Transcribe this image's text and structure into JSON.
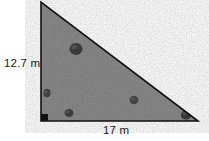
{
  "figure": {
    "type": "right-triangle-diagram",
    "shape_name": "right triangle",
    "background_color": "#ffffff",
    "fill_color": "#8a8a8a",
    "fill_description": "gravel texture",
    "outline_color": "#111111",
    "label_color": "#1a1a1a",
    "vertices": {
      "apex": {
        "x": 41,
        "y": 2
      },
      "right_angle": {
        "x": 41,
        "y": 121
      },
      "base_right": {
        "x": 198,
        "y": 121
      }
    },
    "right_angle_marker": {
      "name": "right-angle-marker",
      "x": 41,
      "y": 114,
      "size": 7,
      "color": "#111111"
    },
    "labels": {
      "height": "12.7 m",
      "base": "17 m"
    },
    "pebbles": [
      {
        "cx": 76,
        "cy": 49,
        "rx": 6.5,
        "ry": 6.0,
        "color": "#3a3a3a"
      },
      {
        "cx": 47,
        "cy": 93,
        "rx": 3.6,
        "ry": 4.2,
        "color": "#3f3f3f"
      },
      {
        "cx": 69,
        "cy": 113,
        "rx": 4.4,
        "ry": 4.0,
        "color": "#3c3c3c"
      },
      {
        "cx": 134,
        "cy": 100,
        "rx": 4.4,
        "ry": 4.2,
        "color": "#444444"
      },
      {
        "cx": 186,
        "cy": 115,
        "rx": 5.2,
        "ry": 4.6,
        "color": "#383838"
      }
    ]
  }
}
